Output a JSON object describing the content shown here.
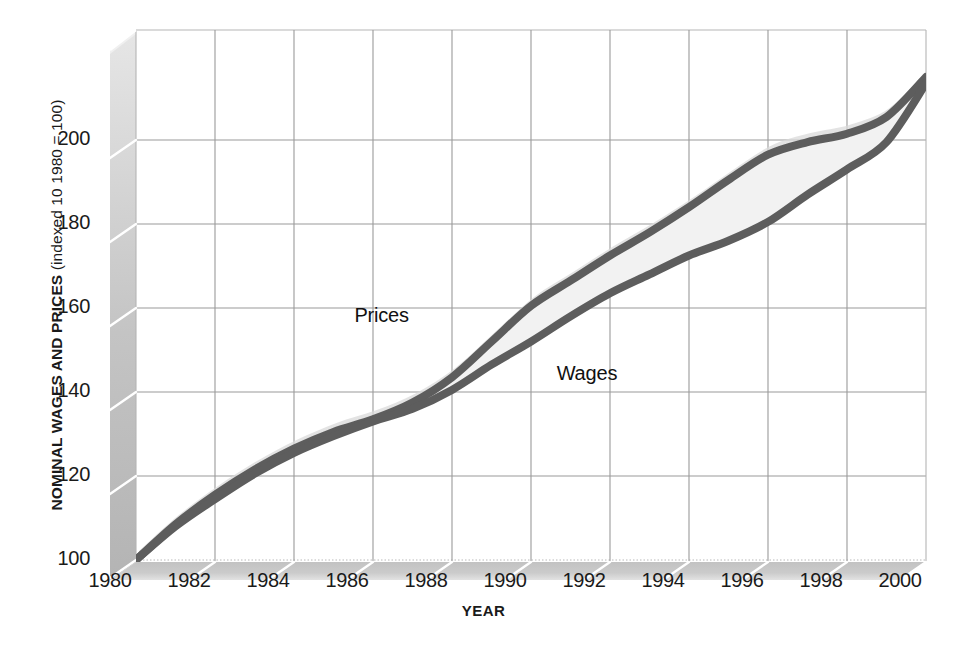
{
  "chart_data": {
    "type": "line",
    "title": "",
    "xlabel": "YEAR",
    "ylabel": "NOMINAL WAGES AND PRICES",
    "ylabel_note": "(indexed 10 1980 = 100)",
    "ylabel_full": "NOMINAL WAGES AND PRICES (indexed 10 1980 = 100)",
    "xlim": [
      1980,
      2000
    ],
    "ylim": [
      100,
      215
    ],
    "grid": true,
    "legend_position": "inline-annotation",
    "style": "pseudo-3d shaded walls, band fill between series",
    "x": [
      1980,
      1981,
      1982,
      1983,
      1984,
      1985,
      1986,
      1987,
      1988,
      1989,
      1990,
      1991,
      1992,
      1993,
      1994,
      1995,
      1996,
      1997,
      1998,
      1999,
      2000
    ],
    "xticks": [
      1980,
      1982,
      1984,
      1986,
      1988,
      1990,
      1992,
      1994,
      1996,
      1998,
      2000
    ],
    "xticklabels": [
      "1980",
      "1982",
      "1984",
      "1986",
      "1988",
      "1990",
      "1992",
      "1994",
      "1996",
      "1998",
      "2000"
    ],
    "yticks": [
      100,
      120,
      140,
      160,
      180,
      200
    ],
    "yticklabels": [
      "100",
      "120",
      "140",
      "160",
      "180",
      "200"
    ],
    "series": [
      {
        "name": "Prices",
        "color": "#5d5d5d",
        "label_x": 1987.2,
        "label_y": 158,
        "values": [
          100,
          108.5,
          115.5,
          121.5,
          126.5,
          130.5,
          133.5,
          137.5,
          143.5,
          152.0,
          160.5,
          166.5,
          172.5,
          178.0,
          184.0,
          190.5,
          196.5,
          199.5,
          201.5,
          205.5,
          215.0
        ]
      },
      {
        "name": "Wages",
        "color": "#5d5d5d",
        "label_x": 1990.6,
        "label_y": 148,
        "values": [
          100,
          108.0,
          114.5,
          120.5,
          125.5,
          129.5,
          133.0,
          136.0,
          140.5,
          146.5,
          152.0,
          158.0,
          163.5,
          168.0,
          172.5,
          176.0,
          180.5,
          187.0,
          193.0,
          199.5,
          213.5
        ]
      }
    ],
    "annotations": [
      {
        "text": "Prices",
        "series": "Prices"
      },
      {
        "text": "Wages",
        "series": "Wages"
      }
    ],
    "colors": {
      "line": "#5d5d5d",
      "band_fill": "#f2f2f2",
      "grid": "#a0a0a0",
      "wall": "#c6c6c6",
      "floor": "#c6c6c6",
      "background": "#ffffff",
      "text": "#1a1a1a"
    }
  }
}
